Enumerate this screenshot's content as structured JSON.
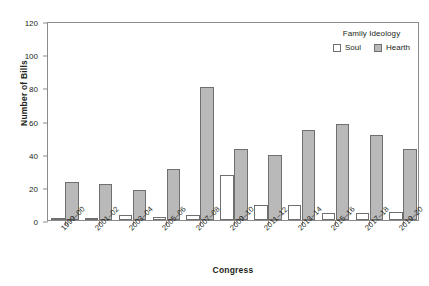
{
  "chart_data": {
    "type": "bar",
    "title": "",
    "xlabel": "Congress",
    "ylabel": "Number of Bills",
    "ylim": [
      0,
      120
    ],
    "yticks": [
      0,
      20,
      40,
      60,
      80,
      100,
      120
    ],
    "grid": false,
    "legend_position": "top-right",
    "legend_title": "Family Ideology",
    "categories": [
      "1999–00",
      "2001–02",
      "2003–04",
      "2005–06",
      "2007–08",
      "2009–10",
      "2011–12",
      "2013–14",
      "2015–16",
      "2017–18",
      "2019–20"
    ],
    "series": [
      {
        "name": "Soul",
        "color": "#ffffff",
        "values": [
          1,
          1,
          3,
          2,
          3,
          27,
          9,
          9,
          4,
          4,
          5
        ]
      },
      {
        "name": "Hearth",
        "color": "#b9b9b9",
        "values": [
          23,
          22,
          18,
          31,
          80,
          43,
          39,
          54,
          58,
          51,
          43
        ]
      }
    ]
  },
  "axes": {
    "y_title": "Number of Bills",
    "x_title": "Congress",
    "y_tick_labels": [
      "0",
      "20",
      "40",
      "60",
      "80",
      "100",
      "120"
    ]
  },
  "legend": {
    "title": "Family Ideology",
    "entries": [
      {
        "label": "Soul"
      },
      {
        "label": "Hearth"
      }
    ]
  }
}
